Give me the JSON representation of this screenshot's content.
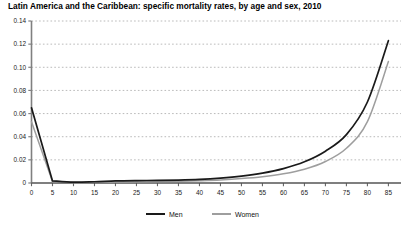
{
  "chart_title": "Latin America and the Caribbean: specific mortality rates, by age and sex, 2010",
  "legend": {
    "men_label": "Men",
    "women_label": "Women"
  },
  "colors": {
    "men_line": "#1a1a1a",
    "women_line": "#9e9e9e",
    "axis": "#808080",
    "grid": "#a8a8a8",
    "text": "#000000"
  },
  "chart_data": {
    "type": "line",
    "title": "Latin America and the Caribbean: specific mortality rates, by age and sex, 2010",
    "xlabel": "",
    "ylabel": "",
    "xlim": [
      0,
      88
    ],
    "ylim": [
      0,
      0.14
    ],
    "grid": true,
    "grid_style": "dotted-horizontal",
    "legend_position": "bottom-center",
    "xticks": [
      0,
      5,
      10,
      15,
      20,
      25,
      30,
      35,
      40,
      45,
      50,
      55,
      60,
      65,
      70,
      75,
      80,
      85
    ],
    "xtick_labels": [
      "0",
      "5",
      "10",
      "15",
      "20",
      "25",
      "30",
      "35",
      "40",
      "45",
      "50",
      "55",
      "60",
      "65",
      "70",
      "75",
      "80",
      "85"
    ],
    "yticks": [
      0,
      0.02,
      0.04,
      0.06,
      0.08,
      0.1,
      0.12,
      0.14
    ],
    "ytick_labels": [
      "0",
      "0.02",
      "0.04",
      "0.06",
      "0.08",
      "0.10",
      "0.12",
      "0.14"
    ],
    "x": [
      0,
      5,
      10,
      15,
      20,
      25,
      30,
      35,
      40,
      45,
      50,
      55,
      60,
      65,
      70,
      75,
      80,
      85
    ],
    "series": [
      {
        "name": "Men",
        "color": "#1a1a1a",
        "values": [
          0.065,
          0.0018,
          0.0007,
          0.0011,
          0.0018,
          0.0021,
          0.0022,
          0.0025,
          0.0031,
          0.0042,
          0.0059,
          0.0085,
          0.0124,
          0.0183,
          0.0275,
          0.0418,
          0.07,
          0.123
        ]
      },
      {
        "name": "Women",
        "color": "#9e9e9e",
        "values": [
          0.053,
          0.0014,
          0.0005,
          0.0006,
          0.0008,
          0.001,
          0.0012,
          0.0015,
          0.002,
          0.0027,
          0.0038,
          0.0054,
          0.0079,
          0.0119,
          0.0186,
          0.03,
          0.053,
          0.105
        ]
      }
    ]
  }
}
